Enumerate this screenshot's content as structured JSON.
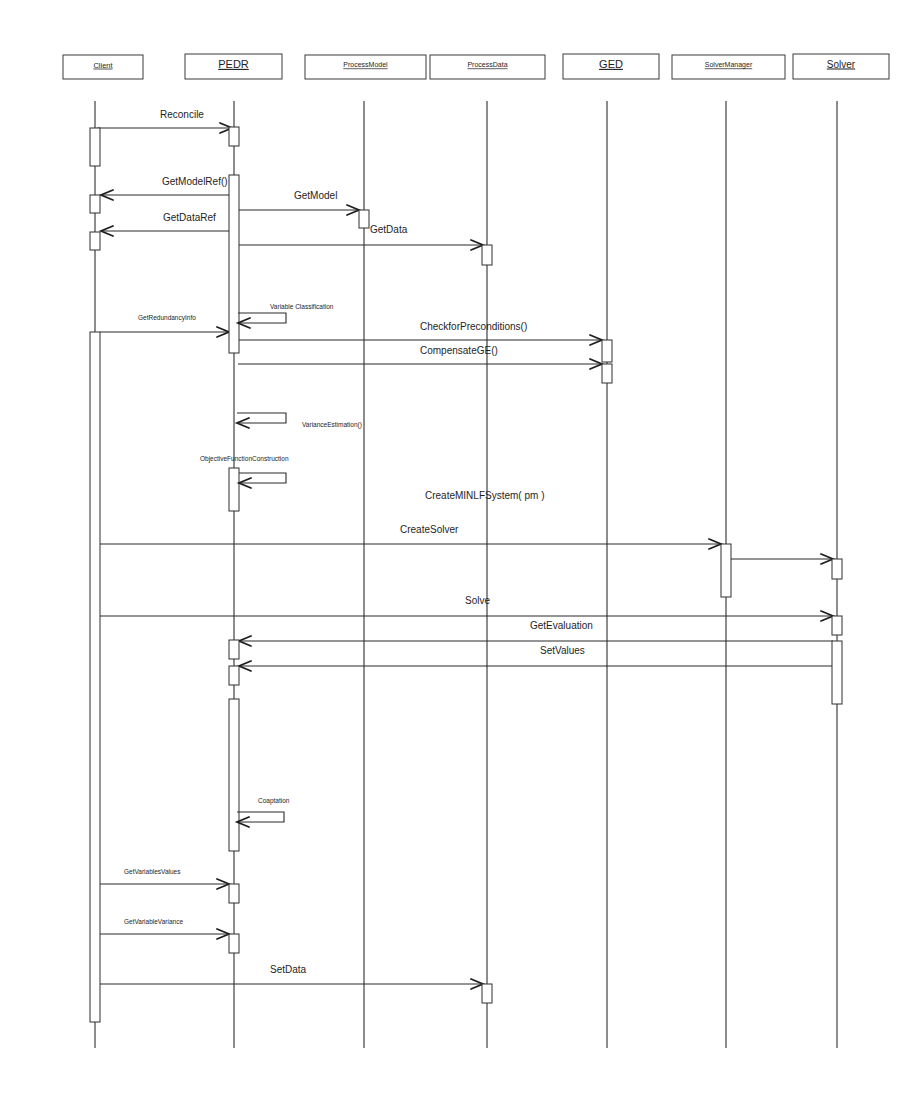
{
  "diagram": {
    "type": "uml-sequence-diagram",
    "participants": [
      {
        "id": "client",
        "name": "Client",
        "box": [
          63,
          55,
          80,
          24
        ],
        "x": 95,
        "font": 7.5
      },
      {
        "id": "pedr",
        "name": "PEDR",
        "box": [
          185,
          54,
          97,
          25
        ],
        "x": 234,
        "font": 11
      },
      {
        "id": "processmodel",
        "name": "ProcessModel",
        "box": [
          305,
          55,
          121,
          24
        ],
        "x": 364,
        "font": 7
      },
      {
        "id": "processdata",
        "name": "ProcessData",
        "box": [
          430,
          55,
          115,
          24
        ],
        "x": 487,
        "font": 7
      },
      {
        "id": "ged",
        "name": "GED",
        "box": [
          563,
          54,
          96,
          25
        ],
        "x": 607,
        "font": 11
      },
      {
        "id": "solvermanager",
        "name": "SolverManager",
        "box": [
          672,
          55,
          113,
          24
        ],
        "x": 726,
        "font": 7
      },
      {
        "id": "solver",
        "name": "Solver",
        "box": [
          793,
          54,
          96,
          25
        ],
        "x": 837,
        "font": 10
      }
    ],
    "lifeline_top": 101,
    "lifeline_bottom": 1048,
    "activations": [
      {
        "participant": "client",
        "y1": 128,
        "y2": 166
      },
      {
        "participant": "client",
        "y1": 195,
        "y2": 213
      },
      {
        "participant": "client",
        "y1": 232,
        "y2": 250
      },
      {
        "participant": "client",
        "y1": 332,
        "y2": 1022
      },
      {
        "participant": "pedr",
        "y1": 127,
        "y2": 146
      },
      {
        "participant": "pedr",
        "y1": 175,
        "y2": 353
      },
      {
        "participant": "processmodel",
        "y1": 210,
        "y2": 228
      },
      {
        "participant": "processdata",
        "y1": 245,
        "y2": 265
      },
      {
        "participant": "ged",
        "y1": 340,
        "y2": 362
      },
      {
        "participant": "ged",
        "y1": 364,
        "y2": 383
      },
      {
        "participant": "pedr",
        "y1": 468,
        "y2": 511
      },
      {
        "participant": "solvermanager",
        "y1": 544,
        "y2": 597
      },
      {
        "participant": "solver",
        "y1": 559,
        "y2": 579
      },
      {
        "participant": "solver",
        "y1": 616,
        "y2": 635
      },
      {
        "participant": "solver",
        "y1": 641,
        "y2": 704
      },
      {
        "participant": "pedr",
        "y1": 640,
        "y2": 659
      },
      {
        "participant": "pedr",
        "y1": 666,
        "y2": 685
      },
      {
        "participant": "pedr",
        "y1": 699,
        "y2": 851
      },
      {
        "participant": "pedr",
        "y1": 884,
        "y2": 903
      },
      {
        "participant": "pedr",
        "y1": 934,
        "y2": 953
      },
      {
        "participant": "processdata",
        "y1": 984,
        "y2": 1003
      }
    ],
    "messages": [
      {
        "label": "Reconcile",
        "from_x": 97,
        "to_x": 232,
        "y": 128,
        "label_x": 160,
        "label_y": 118,
        "font": 10,
        "dir": "right"
      },
      {
        "label": "GetModelRef()",
        "from_x": 230,
        "to_x": 101,
        "y": 195,
        "label_x": 162,
        "label_y": 185,
        "font": 10,
        "dir": "left"
      },
      {
        "label": "GetModel",
        "from_x": 238,
        "to_x": 359,
        "y": 210,
        "label_x": 294,
        "label_y": 199,
        "font": 10,
        "dir": "right"
      },
      {
        "label": "GetDataRef",
        "from_x": 230,
        "to_x": 101,
        "y": 231,
        "label_x": 163,
        "label_y": 221,
        "font": 10,
        "dir": "left"
      },
      {
        "label": "GetData",
        "from_x": 238,
        "to_x": 483,
        "y": 245,
        "label_x": 370,
        "label_y": 233,
        "font": 10,
        "dir": "right"
      },
      {
        "label": "GetRedundancyInfo",
        "from_x": 100,
        "to_x": 229,
        "y": 332,
        "label_x": 138,
        "label_y": 320,
        "font": 6.5,
        "dir": "right"
      },
      {
        "label": "CheckforPreconditions()",
        "from_x": 238,
        "to_x": 602,
        "y": 340,
        "label_x": 420,
        "label_y": 330,
        "font": 10,
        "dir": "right"
      },
      {
        "label": "CompensateGE()",
        "from_x": 238,
        "to_x": 602,
        "y": 364,
        "label_x": 420,
        "label_y": 354,
        "font": 10,
        "dir": "right"
      },
      {
        "label": "CreateSolver",
        "from_x": 100,
        "to_x": 721,
        "y": 544,
        "label_x": 400,
        "label_y": 533,
        "font": 10,
        "dir": "right"
      },
      {
        "label": "",
        "from_x": 731,
        "to_x": 833,
        "y": 559,
        "label_x": 0,
        "label_y": 0,
        "font": 10,
        "dir": "right"
      },
      {
        "label": "Solve",
        "from_x": 100,
        "to_x": 833,
        "y": 616,
        "label_x": 465,
        "label_y": 604,
        "font": 10,
        "dir": "right"
      },
      {
        "label": "GetEvaluation",
        "from_x": 833,
        "to_x": 239,
        "y": 641,
        "label_x": 530,
        "label_y": 629,
        "font": 10,
        "dir": "left"
      },
      {
        "label": "SetValues",
        "from_x": 833,
        "to_x": 239,
        "y": 666,
        "label_x": 540,
        "label_y": 654,
        "font": 10,
        "dir": "left"
      },
      {
        "label": "GetVariablesValues",
        "from_x": 100,
        "to_x": 229,
        "y": 884,
        "label_x": 124,
        "label_y": 874,
        "font": 6.5,
        "dir": "right"
      },
      {
        "label": "GetVariableVariance",
        "from_x": 100,
        "to_x": 229,
        "y": 934,
        "label_x": 124,
        "label_y": 924,
        "font": 6.5,
        "dir": "right"
      },
      {
        "label": "SetData",
        "from_x": 100,
        "to_x": 483,
        "y": 984,
        "label_x": 270,
        "label_y": 973,
        "font": 10,
        "dir": "right"
      }
    ],
    "self_messages": [
      {
        "label": "Variable Classification",
        "x": 238,
        "y1": 313,
        "y2": 323,
        "right": 286,
        "label_x": 270,
        "label_y": 309,
        "font": 6.5
      },
      {
        "label": "VarianceEstimation()",
        "x": 237,
        "y1": 413,
        "y2": 423,
        "right": 286,
        "label_x": 302,
        "label_y": 427,
        "font": 6.5
      },
      {
        "label": "ObjectiveFunctionConstruction",
        "x": 239,
        "y1": 473,
        "y2": 483,
        "right": 286,
        "label_x": 200,
        "label_y": 461,
        "font": 6.5
      },
      {
        "label": "Coaptation",
        "x": 237,
        "y1": 812,
        "y2": 822,
        "right": 284,
        "label_x": 258,
        "label_y": 803,
        "font": 6.5
      }
    ],
    "notes": [
      {
        "label": "CreateMINLFSystem( pm )",
        "x": 425,
        "y": 499,
        "font": 10
      }
    ]
  }
}
